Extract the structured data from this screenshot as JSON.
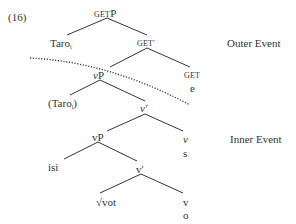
{
  "example_number": "(16)",
  "nodes": {
    "getp": {
      "small": "GET",
      "main": "P"
    },
    "taro": {
      "text": "Taro",
      "sub": "i"
    },
    "getbar": {
      "text": "GET'"
    },
    "vp_outer": {
      "italic": "v",
      "main": "P"
    },
    "get_head": {
      "text": "GET"
    },
    "e": {
      "text": "e"
    },
    "taro_trace": {
      "open": "(Taro",
      "sub": "i",
      "close": ")"
    },
    "vbar_outer": {
      "text": "v'"
    },
    "v_head": {
      "text": "v"
    },
    "s": {
      "text": "s"
    },
    "vp_inner": {
      "text": "vP"
    },
    "isi": {
      "text": "isi"
    },
    "vbar_inner": {
      "text": "v'"
    },
    "root": {
      "text": "√vot"
    },
    "v_inner": {
      "text": "v"
    },
    "o": {
      "text": "o"
    }
  },
  "labels": {
    "outer_event": "Outer Event",
    "inner_event": "Inner Event"
  },
  "colors": {
    "line": "#333333",
    "text": "#333333"
  }
}
